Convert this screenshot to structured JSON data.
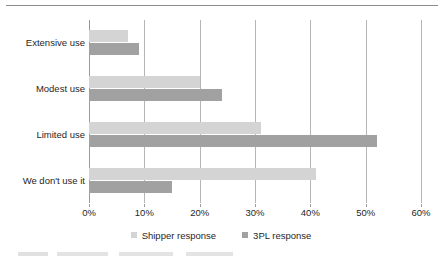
{
  "chart_data": {
    "type": "bar",
    "orientation": "horizontal",
    "title": "",
    "xlabel": "",
    "ylabel": "",
    "categories": [
      "Extensive use",
      "Modest use",
      "Limited use",
      "We don't use it"
    ],
    "series": [
      {
        "name": "Shipper response",
        "color": "#d4d4d4",
        "values": [
          7,
          20,
          31,
          41
        ]
      },
      {
        "name": "3PL response",
        "color": "#a1a1a1",
        "values": [
          9,
          24,
          52,
          15
        ]
      }
    ],
    "xlim": [
      0,
      60
    ],
    "xtick_values": [
      0,
      10,
      20,
      30,
      40,
      50,
      60
    ],
    "xtick_labels": [
      "0%",
      "10%",
      "20%",
      "30%",
      "40%",
      "50%",
      "60%"
    ],
    "grid": "vertical",
    "legend_position": "bottom-center",
    "value_suffix": "%"
  },
  "legend": {
    "items": [
      {
        "label": "Shipper response",
        "swatch": "shipper-swatch"
      },
      {
        "label": "3PL response",
        "swatch": "tpl-swatch"
      }
    ]
  },
  "decor": {
    "top_rule": "horizontal-rule"
  }
}
